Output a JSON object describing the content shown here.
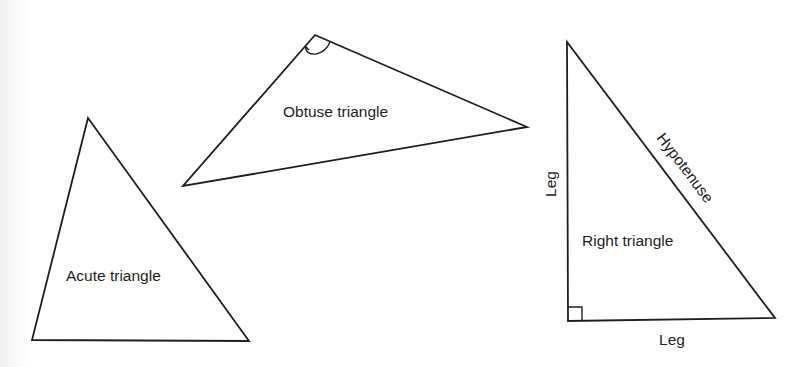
{
  "figure": {
    "stroke_color": "#1e1e1e",
    "background_color": "#ffffff"
  },
  "triangles": [
    {
      "type": "acute",
      "label": "Acute triangle",
      "vertices": [
        [
          88,
          118
        ],
        [
          32,
          340
        ],
        [
          249,
          341
        ]
      ]
    },
    {
      "type": "obtuse",
      "label": "Obtuse triangle",
      "vertices": [
        [
          315,
          35
        ],
        [
          183,
          186
        ],
        [
          527,
          127
        ]
      ],
      "angle_mark": "obtuse-angle-arc"
    },
    {
      "type": "right",
      "label": "Right triangle",
      "vertices": [
        [
          567,
          42
        ],
        [
          568,
          321
        ],
        [
          775,
          318
        ]
      ],
      "angle_mark": "right-angle-square",
      "side_labels": {
        "vertical_leg": "Leg",
        "horizontal_leg": "Leg",
        "hypotenuse": "Hypotenuse"
      }
    }
  ]
}
